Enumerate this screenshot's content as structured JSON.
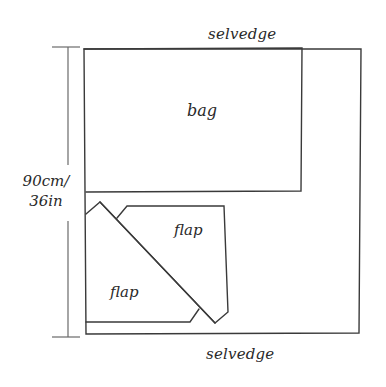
{
  "diagram": {
    "type": "fabric cutting layout",
    "labels": {
      "selvedge_top": "selvedge",
      "selvedge_bottom": "selvedge",
      "bag": "bag",
      "flap_upper": "flap",
      "flap_lower": "flap",
      "dimension_line1": "90cm/",
      "dimension_line2": "36in"
    },
    "colors": {
      "stroke": "#3a3a3a",
      "text": "#2a2a2a",
      "background": "#ffffff"
    },
    "pieces": [
      {
        "name": "bag",
        "shape": "rectangle"
      },
      {
        "name": "flap",
        "shape": "pentagon",
        "position": "upper-right"
      },
      {
        "name": "flap",
        "shape": "pentagon",
        "position": "lower-left"
      }
    ]
  }
}
